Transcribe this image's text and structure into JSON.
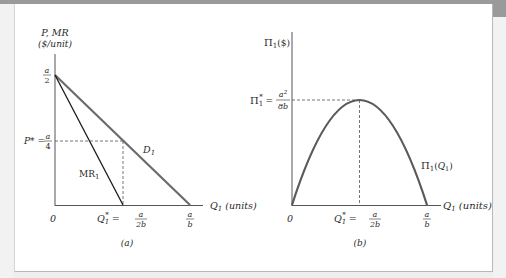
{
  "figure": {
    "panel_a": {
      "caption": "(a)",
      "y_axis_label_line1": "P, MR",
      "y_axis_label_line2": "($/unit)",
      "x_axis_label": "Q₁ (units)",
      "intercept_label": "a/2",
      "price_label_prefix": "P* =",
      "price_value": "a/4",
      "origin_label": "0",
      "quantity_label_prefix": "Q₁* =",
      "quantity_value": "a/2b",
      "demand_intercept": "a/b",
      "curves": [
        {
          "name": "D₁",
          "from": [
            0,
            "a/2"
          ],
          "to": [
            "a/b",
            0
          ]
        },
        {
          "name": "MR₁",
          "from": [
            0,
            "a/2"
          ],
          "to": [
            "a/2b",
            0
          ]
        }
      ]
    },
    "panel_b": {
      "caption": "(b)",
      "y_axis_label": "Π₁($)",
      "x_axis_label": "Q₁ (units)",
      "max_profit_prefix": "Π₁* =",
      "max_profit_value": "a²/8b",
      "origin_label": "0",
      "quantity_label_prefix": "Q₁* =",
      "quantity_value": "a/2b",
      "x_intercept": "a/b",
      "curve_label": "Π₁(Q₁)"
    },
    "colors": {
      "demand_line": "#6b6b6b",
      "mr_line": "#1a1a1a",
      "profit_curve": "#5a5a5a",
      "axes": "#555555",
      "dashed": "#666666"
    }
  }
}
